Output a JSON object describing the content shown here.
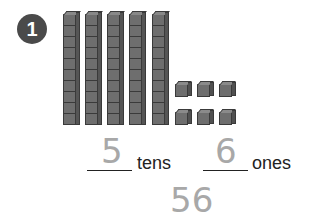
{
  "problem": {
    "number": "1",
    "tens_rods": 5,
    "ones_cubes": 6,
    "tens_answer": "5",
    "tens_label": "tens",
    "ones_answer": "6",
    "ones_label": "ones",
    "total": "56"
  },
  "colors": {
    "badge": "#4a4a4a",
    "block": "#6e6e6e",
    "traced_answer": "#a8a8a8"
  }
}
